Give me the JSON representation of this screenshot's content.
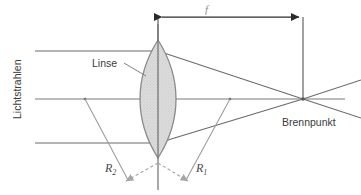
{
  "diagram": {
    "title_label": "Lichtstrahlen",
    "lens_label": "Linse",
    "focal_point_label": "Brennpunkt",
    "focal_length_label": "f",
    "radius_left_label": "R",
    "radius_left_sub": "2",
    "radius_right_label": "R",
    "radius_right_sub": "1",
    "colors": {
      "ray_line": "#6b6b6b",
      "lens_outline": "#8a8a8a",
      "lens_fill": "#d8d8d8",
      "axis": "#7a7a7a",
      "dimension_arrow": "#2b2b2b",
      "radius_arrow": "#9a9a9a",
      "text": "#3b3b3b",
      "background": "#ffffff"
    },
    "geometry": {
      "lens_center_x": 158,
      "lens_center_y": 99,
      "lens_top_y": 40,
      "lens_bottom_y": 158,
      "lens_half_width": 18,
      "focal_point_x": 303,
      "focal_point_y": 99,
      "ray_y_top": 51,
      "ray_y_middle": 99,
      "ray_y_bottom": 143,
      "ray_start_x": 35,
      "axis_end_x": 345,
      "dimension_y": 17,
      "radius_origin_x": 158,
      "radius_origin_y": 163,
      "radius_left_tip_x": 122,
      "radius_left_tip_y": 182,
      "radius_right_tip_x": 190,
      "radius_right_tip_y": 182
    }
  }
}
